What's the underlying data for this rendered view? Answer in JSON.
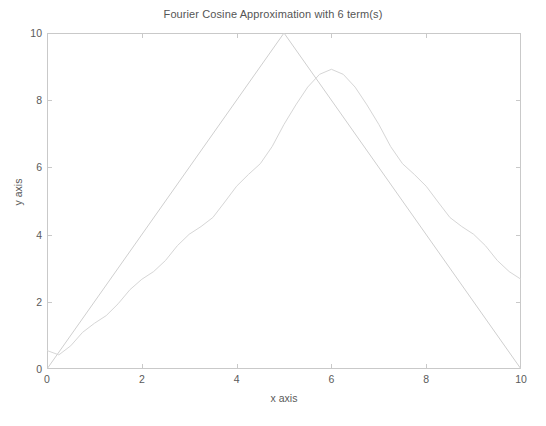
{
  "chart_data": {
    "type": "line",
    "title": "Fourier Cosine Approximation with 6 term(s)",
    "xlabel": "x axis",
    "ylabel": "y axis",
    "xlim": [
      0,
      10
    ],
    "ylim": [
      0,
      10
    ],
    "xticks": [
      0,
      2,
      4,
      6,
      8,
      10
    ],
    "yticks": [
      0,
      2,
      4,
      6,
      8,
      10
    ],
    "xtick_labels": [
      "0",
      "2",
      "4",
      "6",
      "8",
      "10"
    ],
    "ytick_labels": [
      "0",
      "2",
      "4",
      "6",
      "8",
      "10"
    ],
    "grid": false,
    "legend": null,
    "n_terms": 6,
    "series": [
      {
        "name": "Triangle wave (exact)",
        "color": "#cfcfcf",
        "x": [
          0,
          5,
          10
        ],
        "values": [
          0,
          10,
          0
        ]
      },
      {
        "name": "Fourier cosine approximation (6 terms)",
        "color": "#d6d6d6",
        "x": [
          0.0,
          0.25,
          0.5,
          0.75,
          1.0,
          1.25,
          1.5,
          1.75,
          2.0,
          2.25,
          2.5,
          2.75,
          3.0,
          3.25,
          3.5,
          3.75,
          4.0,
          4.25,
          4.5,
          4.75,
          5.0,
          5.25,
          5.5,
          5.75,
          6.0,
          6.25,
          6.5,
          6.75,
          7.0,
          7.25,
          7.5,
          7.75,
          8.0,
          8.25,
          8.5,
          8.75,
          9.0,
          9.25,
          9.5,
          9.75,
          10.0
        ],
        "values": [
          0.55,
          0.42,
          0.69,
          1.09,
          1.36,
          1.59,
          1.94,
          2.36,
          2.67,
          2.9,
          3.23,
          3.67,
          4.01,
          4.24,
          4.51,
          4.97,
          5.44,
          5.79,
          6.11,
          6.62,
          7.28,
          7.86,
          8.39,
          8.77,
          8.92,
          8.77,
          8.39,
          7.86,
          7.28,
          6.62,
          6.11,
          5.79,
          5.44,
          4.97,
          4.51,
          4.24,
          4.01,
          3.67,
          3.23,
          2.9,
          2.67
        ]
      }
    ]
  },
  "figure": {
    "background": "#ffffff",
    "axis_color": "#c9c9c9",
    "text_color": "#5a5a5a",
    "title_color": "#555555"
  }
}
